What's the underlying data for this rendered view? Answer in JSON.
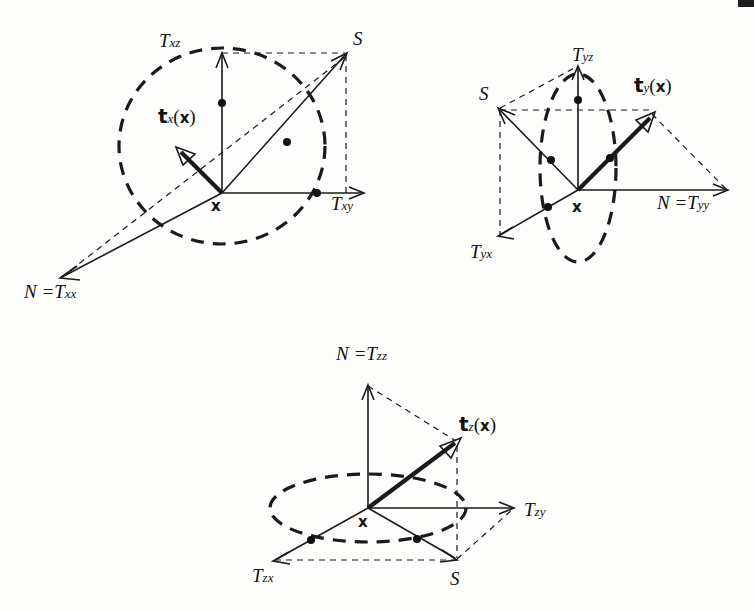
{
  "figure": {
    "background_color": "#fdfdfc",
    "ink_color": "#1a1a1a"
  },
  "diagrams": [
    {
      "id": "diagram-x",
      "name": "x-plane",
      "origin_label": "x",
      "traction_vector": {
        "base": "t",
        "subscript": "x",
        "argument": "(x)"
      },
      "axes": [
        {
          "name": "vertical-axis",
          "label": "T",
          "subscript": "xz"
        },
        {
          "name": "horizontal-axis",
          "label": "T",
          "subscript": "xy"
        },
        {
          "name": "normal-axis",
          "label": "N =",
          "tensor": "T",
          "subscript": "xx"
        }
      ],
      "points": [
        {
          "name": "resultant-point",
          "label": "S"
        }
      ],
      "circle": "dashed-unit-circle"
    },
    {
      "id": "diagram-y",
      "name": "y-plane",
      "origin_label": "x",
      "traction_vector": {
        "base": "t",
        "subscript": "y",
        "argument": "(x)"
      },
      "axes": [
        {
          "name": "vertical-axis",
          "label": "T",
          "subscript": "yz"
        },
        {
          "name": "depth-axis",
          "label": "T",
          "subscript": "yx"
        },
        {
          "name": "normal-axis",
          "label": "N =",
          "tensor": "T",
          "subscript": "yy"
        }
      ],
      "points": [
        {
          "name": "resultant-point",
          "label": "S"
        }
      ],
      "circle": "dashed-unit-ellipse"
    },
    {
      "id": "diagram-z",
      "name": "z-plane",
      "origin_label": "x",
      "traction_vector": {
        "base": "t",
        "subscript": "z",
        "argument": "(x)"
      },
      "axes": [
        {
          "name": "normal-axis",
          "label": "N =",
          "tensor": "T",
          "subscript": "zz"
        },
        {
          "name": "horizontal-axis",
          "label": "T",
          "subscript": "zy"
        },
        {
          "name": "depth-axis",
          "label": "T",
          "subscript": "zx"
        }
      ],
      "points": [
        {
          "name": "resultant-point",
          "label": "S"
        }
      ],
      "circle": "dashed-unit-ellipse"
    }
  ]
}
